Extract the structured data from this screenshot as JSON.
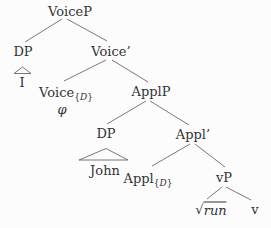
{
  "diagram_title": "syntax-tree-voicep",
  "colors": {
    "background": "#fcfcfc",
    "text": "#333333",
    "line": "#6a6a6a"
  },
  "tree": {
    "nodes": [
      {
        "id": "voicep",
        "x": 70,
        "y": 11,
        "parts": [
          {
            "text": "VoiceP"
          }
        ]
      },
      {
        "id": "dp-subject",
        "x": 23,
        "y": 51,
        "parts": [
          {
            "text": "DP"
          }
        ]
      },
      {
        "id": "voice-bar",
        "x": 111,
        "y": 51,
        "parts": [
          {
            "text": "Voice’"
          }
        ]
      },
      {
        "id": "i",
        "x": 22,
        "y": 82,
        "parts": [
          {
            "text": "I"
          }
        ]
      },
      {
        "id": "voice-d",
        "x": 66,
        "y": 92,
        "parts": [
          {
            "text": "Voice"
          },
          {
            "text": "{",
            "sub": true
          },
          {
            "text": "D",
            "sub": true,
            "italic": true
          },
          {
            "text": "}",
            "sub": true
          }
        ]
      },
      {
        "id": "phi",
        "x": 62,
        "y": 109,
        "parts": [
          {
            "text": "φ",
            "italic": true
          }
        ]
      },
      {
        "id": "applp",
        "x": 151,
        "y": 91,
        "parts": [
          {
            "text": "ApplP"
          }
        ]
      },
      {
        "id": "dp-object",
        "x": 106,
        "y": 133,
        "parts": [
          {
            "text": "DP"
          }
        ]
      },
      {
        "id": "appl-bar",
        "x": 193,
        "y": 134,
        "parts": [
          {
            "text": "Appl’"
          }
        ]
      },
      {
        "id": "john",
        "x": 105,
        "y": 170,
        "parts": [
          {
            "text": "John"
          }
        ]
      },
      {
        "id": "appl-d",
        "x": 148,
        "y": 178,
        "parts": [
          {
            "text": "Appl"
          },
          {
            "text": "{",
            "sub": true
          },
          {
            "text": "D",
            "sub": true,
            "italic": true
          },
          {
            "text": "}",
            "sub": true
          }
        ]
      },
      {
        "id": "vp",
        "x": 224,
        "y": 177,
        "parts": [
          {
            "text": "vP"
          }
        ]
      },
      {
        "id": "root-run",
        "x": 211,
        "y": 209,
        "parts": [
          {
            "text": "√",
            "radical": true
          },
          {
            "text": "run",
            "italic": true,
            "overline": true
          }
        ]
      },
      {
        "id": "v",
        "x": 255,
        "y": 209,
        "parts": [
          {
            "text": "v"
          }
        ]
      }
    ],
    "edges": [
      {
        "name": "edge-voicep-dp",
        "x1": 62,
        "y1": 19,
        "x2": 25,
        "y2": 42
      },
      {
        "name": "edge-voicep-voicebar",
        "x1": 67,
        "y1": 19,
        "x2": 107,
        "y2": 41
      },
      {
        "name": "edge-voicebar-voiced",
        "x1": 106,
        "y1": 60,
        "x2": 64,
        "y2": 81
      },
      {
        "name": "edge-voicebar-applp",
        "x1": 112,
        "y1": 60,
        "x2": 148,
        "y2": 82
      },
      {
        "name": "edge-applp-dp",
        "x1": 146,
        "y1": 101,
        "x2": 107,
        "y2": 124
      },
      {
        "name": "edge-applp-applbar",
        "x1": 150,
        "y1": 101,
        "x2": 189,
        "y2": 125
      },
      {
        "name": "edge-applbar-appld",
        "x1": 190,
        "y1": 144,
        "x2": 152,
        "y2": 166
      },
      {
        "name": "edge-applbar-vp",
        "x1": 195,
        "y1": 144,
        "x2": 225,
        "y2": 167
      },
      {
        "name": "edge-vp-root",
        "x1": 222,
        "y1": 187,
        "x2": 207,
        "y2": 199
      },
      {
        "name": "edge-vp-v",
        "x1": 226,
        "y1": 187,
        "x2": 251,
        "y2": 200
      }
    ],
    "triangles": [
      {
        "name": "roof-i",
        "points": "14,73.5 22.5,67 31,73.5"
      },
      {
        "name": "roof-john",
        "points": "79,160 106,148.5 128,160"
      }
    ]
  }
}
